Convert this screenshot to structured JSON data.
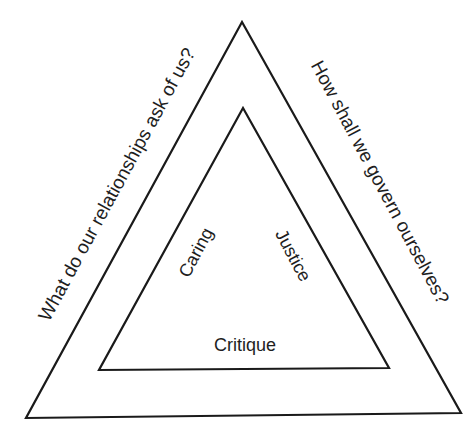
{
  "diagram": {
    "type": "nested-triangles",
    "colors": {
      "background": "#ffffff",
      "stroke": "#1a1a1a",
      "text": "#1e1e1e"
    },
    "outer_triangle": {
      "points": [
        [
          242,
          22
        ],
        [
          26,
          418
        ],
        [
          461,
          413
        ]
      ],
      "left_side_label": "What do our relationships ask of us?",
      "right_side_label": "How shall we govern ourselves?"
    },
    "inner_triangle": {
      "points": [
        [
          243,
          108
        ],
        [
          99,
          370
        ],
        [
          389,
          368
        ]
      ],
      "left_side_label": "Caring",
      "right_side_label": "Justice",
      "bottom_label": "Critique"
    }
  }
}
